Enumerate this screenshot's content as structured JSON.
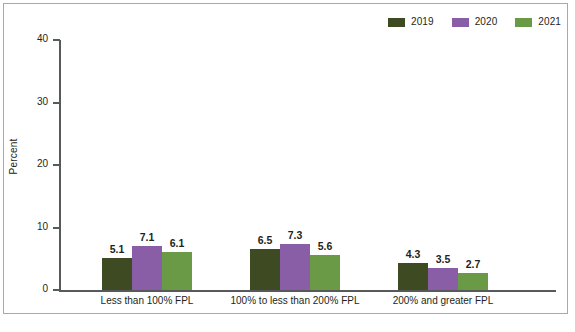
{
  "chart_data": {
    "type": "bar",
    "title": "",
    "subtitle": "",
    "xlabel": "",
    "ylabel": "Percent",
    "ylim": [
      0,
      40
    ],
    "yticks": [
      0,
      10,
      20,
      30,
      40
    ],
    "ytick_labels": [
      "0",
      "10",
      "20",
      "30",
      "40"
    ],
    "grid": false,
    "legend_position": "top-right",
    "categories": [
      "Less than 100% FPL",
      "100% to less than 200% FPL",
      "200% and greater FPL"
    ],
    "series": [
      {
        "name": "2019",
        "color": "#3E4A22",
        "values": [
          5.1,
          6.5,
          4.3
        ]
      },
      {
        "name": "2020",
        "color": "#8A5EA6",
        "values": [
          7.1,
          7.3,
          3.5
        ]
      },
      {
        "name": "2021",
        "color": "#6B9A47",
        "values": [
          6.1,
          5.6,
          2.7
        ]
      }
    ],
    "value_labels": [
      [
        "5.1",
        "7.1",
        "6.1"
      ],
      [
        "6.5",
        "7.3",
        "5.6"
      ],
      [
        "4.3",
        "3.5",
        "2.7"
      ]
    ]
  },
  "legend": {
    "items": [
      {
        "label": "2019",
        "color": "#3E4A22"
      },
      {
        "label": "2020",
        "color": "#8A5EA6"
      },
      {
        "label": "2021",
        "color": "#6B9A47"
      }
    ]
  },
  "axes": {
    "y_title": "Percent",
    "y_ticks": [
      "40",
      "30",
      "20",
      "10",
      "0"
    ]
  },
  "x_categories": [
    "Less than 100% FPL",
    "100% to less than 200% FPL",
    "200% and greater FPL"
  ],
  "footer": {
    "caption_cutoff": ""
  },
  "colors": {
    "axis": "#58595b",
    "text": "#231f20",
    "frame": "#a9a9a9",
    "background": "#ffffff"
  }
}
